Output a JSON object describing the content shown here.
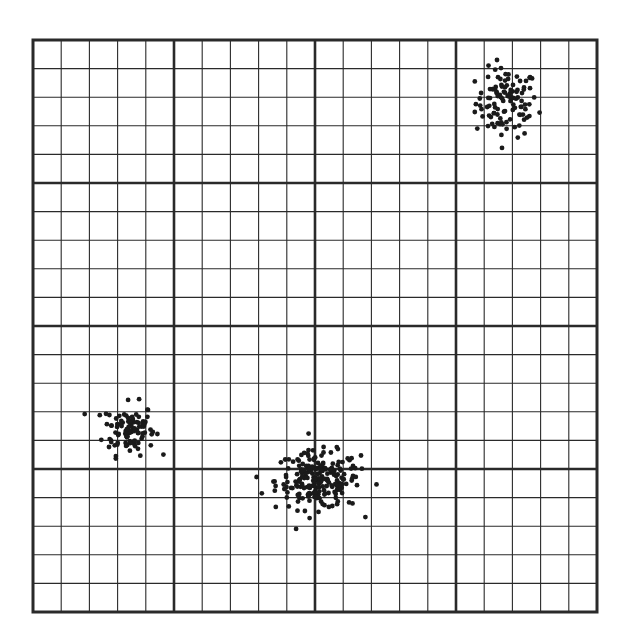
{
  "chart_data": {
    "type": "scatter",
    "title": "",
    "xlabel": "",
    "ylabel": "",
    "xlim": [
      0,
      20
    ],
    "ylim": [
      0,
      20
    ],
    "grid": true,
    "major_divisions": 4,
    "minor_per_major": 5,
    "legend": null,
    "series": [
      {
        "name": "cluster-top-right",
        "center": [
          16.8,
          17.8
        ],
        "spread": [
          0.55,
          0.6
        ],
        "n_points": 110
      },
      {
        "name": "cluster-bottom-left",
        "center": [
          3.4,
          6.4
        ],
        "spread": [
          0.45,
          0.45
        ],
        "n_points": 100
      },
      {
        "name": "cluster-bottom-center",
        "center": [
          10.1,
          4.6
        ],
        "spread": [
          0.75,
          0.5
        ],
        "n_points": 220
      }
    ]
  },
  "style": {
    "frame_px": {
      "left": 33,
      "top": 40,
      "right": 597,
      "bottom": 612
    },
    "line_color": "#2a2a2a",
    "point_color": "#1a1a1a",
    "background": "#ffffff"
  }
}
